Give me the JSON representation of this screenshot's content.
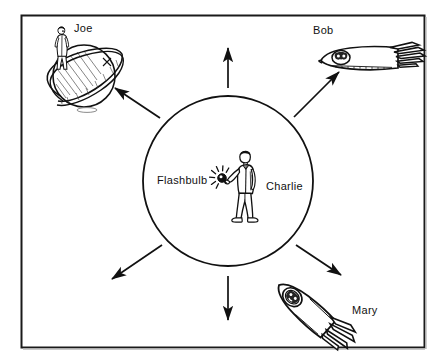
{
  "figure": {
    "frame": {
      "border_color": "#1a1a1a",
      "background_color": "#ffffff"
    },
    "center": {
      "observer_label": "Charlie",
      "source_label": "Flashbulb",
      "icon_name": "man-holding-flashbulb"
    },
    "wavefront": {
      "name": "light-sphere",
      "stroke_color": "#111111"
    },
    "observers": [
      {
        "label": "Joe",
        "icon_name": "person-standing-on-ringed-planet",
        "position": "top-left"
      },
      {
        "label": "Bob",
        "icon_name": "rocket-with-person-pointing-left",
        "position": "top-right"
      },
      {
        "label": "Mary",
        "icon_name": "rocket-with-person-pointing-down-right",
        "position": "bottom-right"
      }
    ],
    "arrows": [
      {
        "name": "arrow-up",
        "direction": "up"
      },
      {
        "name": "arrow-up-right",
        "direction": "up-right"
      },
      {
        "name": "arrow-down-right",
        "direction": "down-right"
      },
      {
        "name": "arrow-down",
        "direction": "down"
      },
      {
        "name": "arrow-down-left",
        "direction": "down-left"
      },
      {
        "name": "arrow-up-left",
        "direction": "up-left"
      }
    ]
  }
}
